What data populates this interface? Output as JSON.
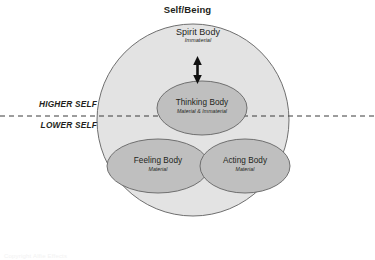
{
  "diagram": {
    "title": "Self/Being",
    "axis_labels": {
      "upper": "HIGHER SELF",
      "lower": "LOWER SELF"
    },
    "bodies": [
      {
        "id": "spirit",
        "name": "Spirit Body",
        "qualifier": "Immaterial"
      },
      {
        "id": "thinking",
        "name": "Thinking Body",
        "qualifier": "Material & Immaterial"
      },
      {
        "id": "feeling",
        "name": "Feeling Body",
        "qualifier": "Material"
      },
      {
        "id": "acting",
        "name": "Acting Body",
        "qualifier": "Material"
      }
    ],
    "connector": {
      "name": "spirit-thinking-double-arrow"
    },
    "colors": {
      "outer_circle_fill": "#e3e3e3",
      "inner_ellipse_fill": "#bfbfbf",
      "stroke": "#6f6f6f",
      "divider_line": "#3a3a3a",
      "text": "#231f20"
    },
    "caption": "Copyright Alfie Effects"
  }
}
